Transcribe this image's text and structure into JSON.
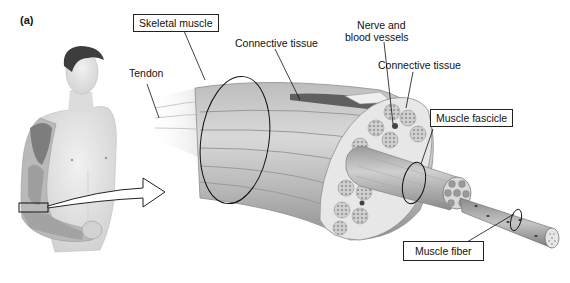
{
  "figure": {
    "panel_label": "(a)",
    "labels": {
      "skeletal_muscle": "Skeletal muscle",
      "tendon": "Tendon",
      "connective_tissue_1": "Connective tissue",
      "nerve_and_blood_vessels_line1": "Nerve and",
      "nerve_and_blood_vessels_line2": "blood vessels",
      "connective_tissue_2": "Connective tissue",
      "muscle_fascicle": "Muscle fascicle",
      "muscle_fiber": "Muscle fiber"
    },
    "colors": {
      "muscle_light": "#d6d6d6",
      "muscle_mid": "#a9a9a9",
      "muscle_dark": "#7d7d7d",
      "skin": "#e6e6e6",
      "line": "#222222"
    }
  }
}
